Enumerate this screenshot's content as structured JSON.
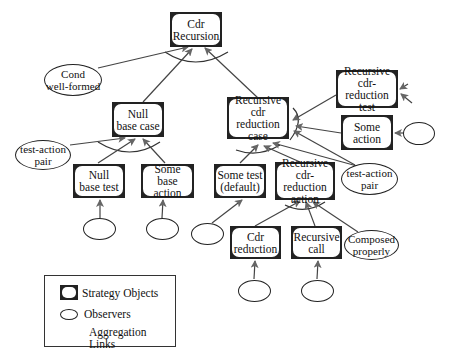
{
  "diagram": {
    "nodes": {
      "cdr_recursion": "Cdr\nRecursion",
      "null_base_case": "Null\nbase case",
      "recursive_cdr_reduction_case": "Recursive\ncdr reduction\ncase",
      "recursive_cdr_reduction_test": "Recursive\ncdr-reduction\ntest",
      "some_action": "Some\naction",
      "null_base_test": "Null\nbase test",
      "some_base_action": "Some\nbase action",
      "some_test_default": "Some test\n(default)",
      "recursive_cdr_reduction_action": "Recursive\ncdr-reduction\naction",
      "cdr_reduction": "Cdr\nreduction",
      "recursive_call": "Recursive\ncall"
    },
    "observers": {
      "cond_well_formed": "Cond\nwell-formed",
      "test_action_pair_left": "test-action\npair",
      "test_action_pair_right": "test-action\npair",
      "composed_properly": "Composed\nproperly"
    },
    "edges": [
      [
        "Null base case",
        "Cdr Recursion"
      ],
      [
        "Recursive cdr reduction case",
        "Cdr Recursion"
      ],
      [
        "Cond well-formed",
        "Cdr Recursion"
      ],
      [
        "Null base test",
        "Null base case"
      ],
      [
        "Some base action",
        "Null base case"
      ],
      [
        "test-action pair",
        "Null base case"
      ],
      [
        "Recursive cdr-reduction test",
        "Recursive cdr reduction case"
      ],
      [
        "Some action",
        "Recursive cdr reduction case"
      ],
      [
        "test-action pair",
        "Recursive cdr reduction case"
      ],
      [
        "Some test (default)",
        "Recursive cdr reduction case"
      ],
      [
        "Recursive cdr-reduction action",
        "Recursive cdr reduction case"
      ],
      [
        "Cdr reduction",
        "Recursive cdr-reduction action"
      ],
      [
        "Recursive call",
        "Recursive cdr-reduction action"
      ],
      [
        "Composed properly",
        "Recursive cdr-reduction action"
      ]
    ]
  },
  "legend": {
    "strategy_objects": "Strategy Objects",
    "observers": "Observers",
    "aggregation_links": "Aggregation Links"
  },
  "colors": {
    "node_border": "#222222",
    "arrow": "#555555",
    "line": "#333333"
  }
}
